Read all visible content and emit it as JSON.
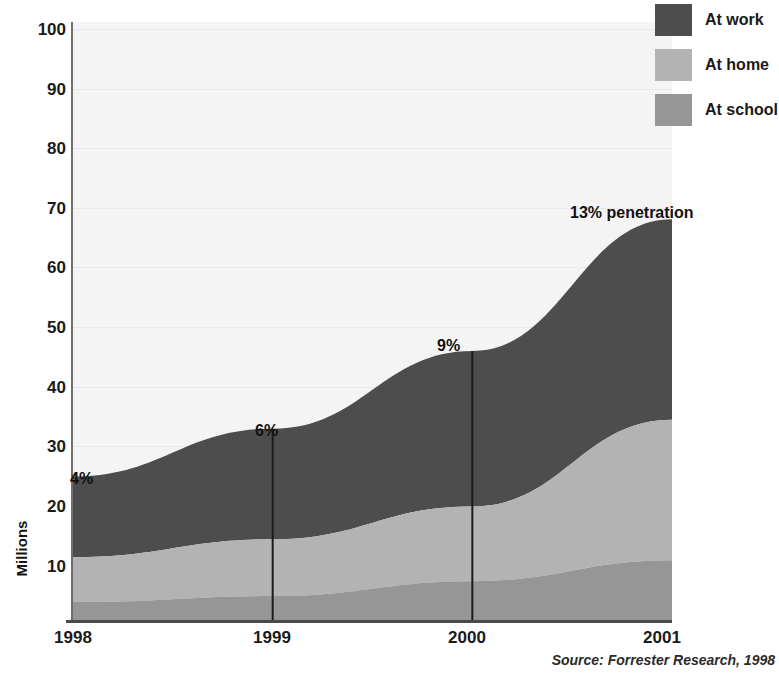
{
  "chart_data": {
    "type": "area",
    "title": "",
    "subtitle": "",
    "xlabel": "",
    "ylabel": "Millions",
    "x": [
      "1998",
      "1999",
      "2000",
      "2001"
    ],
    "categories": [
      "1998",
      "1999",
      "2000",
      "2001"
    ],
    "xlim": [
      1998,
      2001
    ],
    "ylim": [
      0,
      100
    ],
    "stacked": true,
    "grid": true,
    "legend_position": "top-right",
    "yticks": [
      10,
      20,
      30,
      40,
      50,
      60,
      70,
      80,
      90,
      100
    ],
    "ytick_labels": [
      "10",
      "20",
      "30",
      "40",
      "50",
      "60",
      "70",
      "80",
      "90",
      "100"
    ],
    "series": [
      {
        "name": "At work",
        "values": [
          13.5,
          18.5,
          26.0,
          33.5
        ],
        "color": "#4d4d4d"
      },
      {
        "name": "At home",
        "values": [
          7.5,
          9.5,
          12.5,
          23.5
        ],
        "color": "#b3b3b3"
      },
      {
        "name": "At school",
        "values": [
          3.0,
          4.0,
          6.5,
          10.0
        ],
        "color": "#969696"
      }
    ],
    "totals": [
      24,
      32,
      45,
      67
    ],
    "annotations": [
      {
        "label": "4%",
        "x": "1998",
        "value": 24
      },
      {
        "label": "6%",
        "x": "1999",
        "value": 32
      },
      {
        "label": "9%",
        "x": "2000",
        "value": 45
      },
      {
        "label": "13% penetration",
        "x": "2001",
        "value": 67
      }
    ],
    "dividers": [
      "1999",
      "2000"
    ],
    "source": "Source: Forrester Research, 1998"
  },
  "legend": {
    "items": [
      {
        "label": "At work",
        "color": "#4d4d4d"
      },
      {
        "label": "At home",
        "color": "#b3b3b3"
      },
      {
        "label": "At school",
        "color": "#969696"
      }
    ]
  },
  "axes": {
    "y_title": "Millions",
    "y_ticks": [
      "100",
      "90",
      "80",
      "70",
      "60",
      "50",
      "40",
      "30",
      "20",
      "10"
    ],
    "x_ticks": [
      "1998",
      "1999",
      "2000",
      "2001"
    ]
  },
  "annotations": {
    "a1998": "4%",
    "a1999": "6%",
    "a2000": "9%",
    "a2001": "13% penetration"
  },
  "footer": {
    "source": "Source: Forrester Research, 1998"
  },
  "colors": {
    "at_work": "#4d4d4d",
    "at_home": "#b3b3b3",
    "at_school": "#969696",
    "plot_background": "#f4f4f4",
    "axis": "#4a4a4a"
  }
}
